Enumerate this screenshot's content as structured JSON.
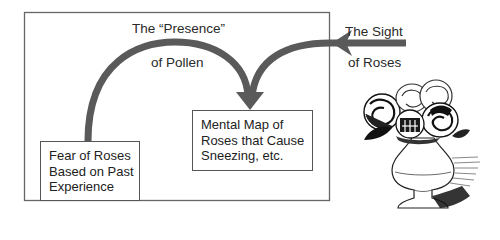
{
  "diagram": {
    "arrow_labels": {
      "pollen_line1": "The “Presence”",
      "pollen_line2": "of Pollen",
      "sight_line1": "The Sight",
      "sight_line2": "of Roses"
    },
    "boxes": {
      "fear": {
        "lines": [
          "Fear of Roses",
          "Based on Past",
          "Experience"
        ]
      },
      "mental_map": {
        "lines": [
          "Mental Map of",
          "Roses that Cause",
          "Sneezing, etc."
        ]
      }
    },
    "illustration": "roses-in-vase",
    "colors": {
      "arrow": "#5a5a5a",
      "frame": "#666666",
      "text": "#222222"
    }
  }
}
